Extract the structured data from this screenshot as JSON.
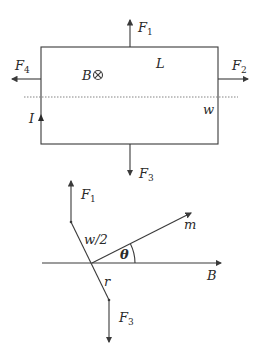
{
  "top_diagram": {
    "loop_label_length": "L",
    "loop_label_width": "w",
    "field_label": "B",
    "field_symbol": "⊗",
    "current_label": "I",
    "forces": [
      {
        "name": "F",
        "sub": "1",
        "direction": "up"
      },
      {
        "name": "F",
        "sub": "2",
        "direction": "right"
      },
      {
        "name": "F",
        "sub": "3",
        "direction": "down"
      },
      {
        "name": "F",
        "sub": "4",
        "direction": "left"
      }
    ]
  },
  "bottom_diagram": {
    "force_top": {
      "name": "F",
      "sub": "1"
    },
    "force_bottom": {
      "name": "F",
      "sub": "3"
    },
    "half_width_label": "w/2",
    "lever_label": "r",
    "moment_label": "m",
    "angle_label": "θ",
    "field_label": "B"
  },
  "colors": {
    "stroke": "#3a3a3a",
    "text": "#2a2a2a",
    "background": "#ffffff"
  }
}
